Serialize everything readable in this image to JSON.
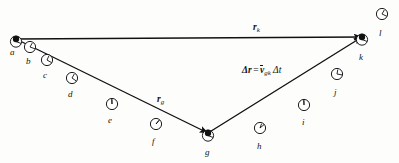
{
  "figure": {
    "background_color": "#fdfdfb",
    "ink_color": "#111111",
    "width": 399,
    "height": 163
  },
  "vectors": [
    {
      "id": "r_k",
      "symbol": "r",
      "subscript": "k",
      "label": "r_k",
      "from": "a",
      "to": "k",
      "x1": 16,
      "y1": 39,
      "x2": 362,
      "y2": 37,
      "label_x": 253,
      "label_y": 23
    },
    {
      "id": "r_g",
      "symbol": "r",
      "subscript": "g",
      "label": "r_g",
      "from": "a",
      "to": "g",
      "x1": 16,
      "y1": 39,
      "x2": 208,
      "y2": 133,
      "label_x": 157,
      "label_y": 95
    },
    {
      "id": "delta_r",
      "symbol": "Δr",
      "subscript": "",
      "label": "Δr",
      "from": "g",
      "to": "k",
      "x1": 208,
      "y1": 133,
      "x2": 362,
      "y2": 37,
      "label_x": 0,
      "label_y": 0
    }
  ],
  "equation": {
    "text": "Δr = v̄_gk Δt",
    "parts": {
      "delta": "Δ",
      "r": "r",
      "equals": "=",
      "vbar": "v",
      "v_subscript": "gk",
      "delta2": "Δ",
      "t": "t"
    },
    "x": 242,
    "y": 66
  },
  "points": [
    {
      "label": "a",
      "x": 16,
      "y": 39,
      "label_x": 10,
      "label_y": 48,
      "vertex": true,
      "clock_angle_hour": 300,
      "clock_angle_min": 20
    },
    {
      "label": "b",
      "x": 30,
      "y": 47,
      "label_x": 26,
      "label_y": 57,
      "vertex": false,
      "clock_angle_hour": 300,
      "clock_angle_min": 20
    },
    {
      "label": "c",
      "x": 47,
      "y": 60,
      "label_x": 43,
      "label_y": 71,
      "vertex": false,
      "clock_angle_hour": 295,
      "clock_angle_min": 30
    },
    {
      "label": "d",
      "x": 72,
      "y": 78,
      "label_x": 68,
      "label_y": 90,
      "vertex": false,
      "clock_angle_hour": 300,
      "clock_angle_min": 35
    },
    {
      "label": "e",
      "x": 112,
      "y": 104,
      "label_x": 108,
      "label_y": 116,
      "vertex": false,
      "clock_angle_hour": 268,
      "clock_angle_min": 268
    },
    {
      "label": "f",
      "x": 156,
      "y": 124,
      "label_x": 152,
      "label_y": 137,
      "vertex": false,
      "clock_angle_hour": 310,
      "clock_angle_min": 310
    },
    {
      "label": "g",
      "x": 208,
      "y": 133,
      "label_x": 205,
      "label_y": 148,
      "vertex": true,
      "clock_angle_hour": 280,
      "clock_angle_min": 20
    },
    {
      "label": "h",
      "x": 260,
      "y": 128,
      "label_x": 257,
      "label_y": 142,
      "vertex": false,
      "clock_angle_hour": 290,
      "clock_angle_min": 320
    },
    {
      "label": "i",
      "x": 304,
      "y": 105,
      "label_x": 302,
      "label_y": 118,
      "vertex": false,
      "clock_angle_hour": 268,
      "clock_angle_min": 268
    },
    {
      "label": "j",
      "x": 337,
      "y": 74,
      "label_x": 334,
      "label_y": 88,
      "vertex": false,
      "clock_angle_hour": 280,
      "clock_angle_min": 10
    },
    {
      "label": "k",
      "x": 362,
      "y": 37,
      "label_x": 359,
      "label_y": 53,
      "vertex": true,
      "clock_angle_hour": 290,
      "clock_angle_min": 20
    },
    {
      "label": "l",
      "x": 382,
      "y": 14,
      "label_x": 379,
      "label_y": 29,
      "vertex": false,
      "clock_angle_hour": 300,
      "clock_angle_min": 25
    }
  ]
}
